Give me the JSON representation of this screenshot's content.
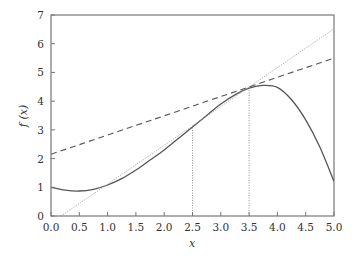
{
  "chart_data": {
    "type": "line",
    "title": "",
    "xlabel": "x",
    "ylabel": "f (x)",
    "xlim": [
      0,
      5
    ],
    "ylim": [
      0,
      7
    ],
    "grid": false,
    "legend": null,
    "x_ticks": [
      "0.0",
      "0.5",
      "1.0",
      "1.5",
      "2.0",
      "2.5",
      "3.0",
      "3.5",
      "4.0",
      "4.5",
      "5.0"
    ],
    "y_ticks": [
      "0",
      "1",
      "2",
      "3",
      "4",
      "5",
      "6",
      "7"
    ],
    "series": [
      {
        "name": "f(x)",
        "style": "solid",
        "x": [
          0.0,
          0.25,
          0.5,
          0.75,
          1.0,
          1.25,
          1.5,
          1.75,
          2.0,
          2.25,
          2.5,
          2.75,
          3.0,
          3.25,
          3.5,
          3.75,
          4.0,
          4.25,
          4.5,
          4.75,
          5.0
        ],
        "values": [
          1.0,
          0.9,
          0.87,
          0.93,
          1.08,
          1.3,
          1.6,
          1.95,
          2.3,
          2.7,
          3.1,
          3.5,
          3.9,
          4.22,
          4.45,
          4.55,
          4.48,
          4.05,
          3.35,
          2.4,
          1.2
        ]
      },
      {
        "name": "tangent at x=3.5",
        "style": "dashed",
        "x": [
          0.0,
          5.0
        ],
        "values": [
          2.15,
          5.5
        ]
      },
      {
        "name": "secant through x=2.5 and x=3.5",
        "style": "dotted",
        "x": [
          0.18,
          5.0
        ],
        "values": [
          0.0,
          6.52
        ]
      }
    ],
    "annotations": [
      {
        "type": "vline-dotted",
        "x": 2.5,
        "from": 0,
        "to": 3.1
      },
      {
        "type": "vline-dotted",
        "x": 3.5,
        "from": 0,
        "to": 4.45
      }
    ]
  }
}
